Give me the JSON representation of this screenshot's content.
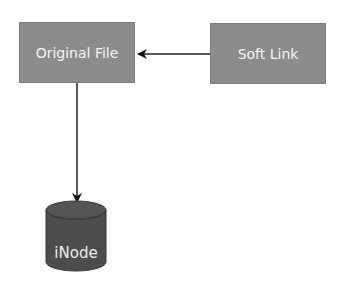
{
  "diagram": {
    "nodes": [
      {
        "id": "original-file",
        "label": "Original File",
        "shape": "rectangle",
        "color": "#8c8c8c"
      },
      {
        "id": "soft-link",
        "label": "Soft Link",
        "shape": "rectangle",
        "color": "#8c8c8c"
      },
      {
        "id": "inode",
        "label": "iNode",
        "shape": "cylinder",
        "color": "#4d4d4d"
      }
    ],
    "edges": [
      {
        "from": "soft-link",
        "to": "original-file",
        "style": "arrow"
      },
      {
        "from": "original-file",
        "to": "inode",
        "style": "arrow"
      }
    ]
  }
}
